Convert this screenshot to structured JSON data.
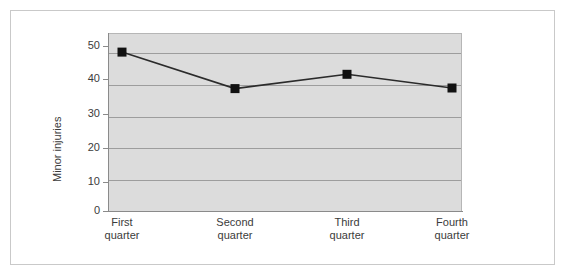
{
  "chart_data": {
    "type": "line",
    "title": "",
    "subtitle": "",
    "xlabel": "",
    "ylabel": "Minor injuries",
    "categories": [
      "First quarter",
      "Second quarter",
      "Third quarter",
      "Fourth quarter"
    ],
    "category_lines": [
      [
        "First",
        "quarter"
      ],
      [
        "Second",
        "quarter"
      ],
      [
        "Third",
        "quarter"
      ],
      [
        "Fourth",
        "quarter"
      ]
    ],
    "values": [
      50,
      38.5,
      43,
      38.7
    ],
    "series": [
      {
        "name": "Minor injuries",
        "values": [
          50,
          38.5,
          43,
          38.7
        ]
      }
    ],
    "ylim": [
      0,
      56
    ],
    "ytick_labels": [
      "0",
      "10",
      "20",
      "30",
      "40",
      "50"
    ],
    "yticks": [
      0,
      10,
      20,
      30,
      40,
      50
    ],
    "grid": true,
    "grid_axis": "y",
    "legend": false,
    "legend_position": "none",
    "marker": "square",
    "marker_color": "#111111",
    "line_color": "#2b2b2b",
    "plot_background": "#dcdcdc",
    "gridline_color": "#9d9d9d",
    "figure_background": "#ffffff",
    "frame_color": "#c9c9c9",
    "text_color": "#3b3b3b"
  },
  "axis": {
    "y_title": "Minor injuries"
  }
}
